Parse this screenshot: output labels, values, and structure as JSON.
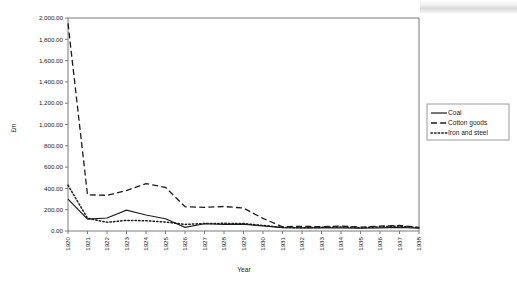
{
  "chart_data": {
    "type": "line",
    "title": "",
    "xlabel": "Year",
    "ylabel": "£m",
    "x": [
      1920,
      1921,
      1922,
      1923,
      1924,
      1925,
      1926,
      1927,
      1928,
      1929,
      1930,
      1931,
      1932,
      1933,
      1934,
      1935,
      1936,
      1937,
      1938
    ],
    "categories": [
      "1920",
      "1921",
      "1922",
      "1923",
      "1924",
      "1925",
      "1926",
      "1927",
      "1928",
      "1929",
      "1930",
      "1931",
      "1932",
      "1933",
      "1934",
      "1935",
      "1936",
      "1937",
      "1938"
    ],
    "xlim": [
      1920,
      1938
    ],
    "ylim": [
      0,
      2000
    ],
    "ytick_labels": [
      "0.00",
      "200.00",
      "400.00",
      "600.00",
      "800.00",
      "1,000.00",
      "1,200.00",
      "1,400.00",
      "1,600.00",
      "1,800.00",
      "2,000.00"
    ],
    "ytick_values": [
      0,
      200,
      400,
      600,
      800,
      1000,
      1200,
      1400,
      1600,
      1800,
      2000
    ],
    "grid": false,
    "legend_position": "right",
    "series": [
      {
        "name": "Coal",
        "style": "solid",
        "color": "#1c1c1c",
        "values": [
          300,
          112,
          122,
          196,
          150,
          115,
          35,
          68,
          62,
          64,
          48,
          32,
          30,
          30,
          30,
          26,
          30,
          34,
          26
        ]
      },
      {
        "name": "Cotton goods",
        "style": "dashed",
        "color": "#1c1c1c",
        "values": [
          1950,
          340,
          335,
          380,
          445,
          410,
          228,
          222,
          230,
          215,
          118,
          40,
          44,
          40,
          46,
          36,
          46,
          52,
          34
        ]
      },
      {
        "name": "Iron and steel",
        "style": "dotted",
        "color": "#1c1c1c",
        "values": [
          430,
          120,
          82,
          100,
          96,
          84,
          62,
          70,
          72,
          70,
          52,
          34,
          30,
          34,
          38,
          30,
          40,
          46,
          30
        ]
      }
    ]
  },
  "legend": {
    "items": [
      {
        "label": "Coal",
        "style": "solid"
      },
      {
        "label": "Cotton goods",
        "style": "dashed"
      },
      {
        "label": "Iron and steel",
        "style": "dotted"
      }
    ]
  }
}
